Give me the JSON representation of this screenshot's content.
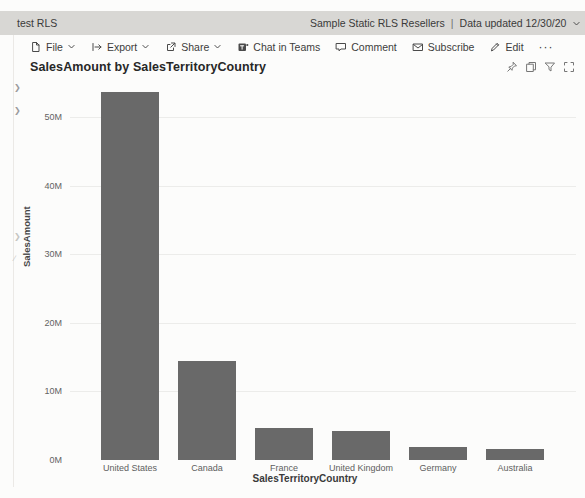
{
  "top_bar": {
    "app_title": "test RLS",
    "report_title": "Sample Static RLS Resellers",
    "separator": "|",
    "data_updated": "Data updated 12/30/20"
  },
  "toolbar": {
    "items": [
      {
        "label": "File",
        "icon": "file-icon",
        "has_dropdown": true
      },
      {
        "label": "Export",
        "icon": "export-icon",
        "has_dropdown": true
      },
      {
        "label": "Share",
        "icon": "share-icon",
        "has_dropdown": true
      },
      {
        "label": "Chat in Teams",
        "icon": "teams-icon",
        "has_dropdown": false
      },
      {
        "label": "Comment",
        "icon": "comment-icon",
        "has_dropdown": false
      },
      {
        "label": "Subscribe",
        "icon": "envelope-icon",
        "has_dropdown": false
      },
      {
        "label": "Edit",
        "icon": "pencil-icon",
        "has_dropdown": false
      }
    ],
    "more_label": "···"
  },
  "visual_header": {
    "icons": [
      "pin-icon",
      "copy-icon",
      "filter-icon",
      "focus-mode-icon"
    ]
  },
  "chart_data": {
    "type": "bar",
    "title": "SalesAmount by SalesTerritoryCountry",
    "categories": [
      "United States",
      "Canada",
      "France",
      "United Kingdom",
      "Germany",
      "Australia"
    ],
    "values": [
      53.6,
      14.4,
      4.6,
      4.3,
      1.9,
      1.6
    ],
    "unit": "M",
    "xlabel": "SalesTerritoryCountry",
    "ylabel": "SalesAmount",
    "ylim": [
      0,
      55
    ],
    "ytick_values": [
      0,
      10,
      20,
      30,
      40,
      50
    ],
    "ytick_labels": [
      "0M",
      "10M",
      "20M",
      "30M",
      "40M",
      "50M"
    ],
    "grid": true,
    "legend": "none",
    "bar_color": "#696969"
  },
  "colors": {
    "top_bar_bg": "#d8d7d4",
    "bar_fill": "#696969",
    "gridline": "#ececea",
    "background": "#fcfcfb"
  }
}
